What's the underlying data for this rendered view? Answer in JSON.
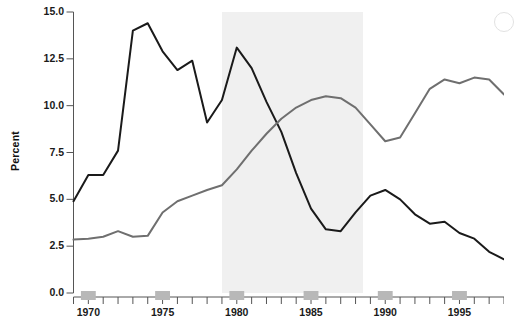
{
  "chart_data": {
    "type": "line",
    "title": "",
    "subtitle": "",
    "xlabel": "",
    "ylabel": "Percent",
    "xlim": [
      1969,
      1998
    ],
    "ylim": [
      0.0,
      15.0
    ],
    "grid": false,
    "legend_position": "none",
    "y_ticks": [
      "0.0",
      "2.5",
      "5.0",
      "7.5",
      "10.0",
      "12.5",
      "15.0"
    ],
    "y_tick_values": [
      0.0,
      2.5,
      5.0,
      7.5,
      10.0,
      12.5,
      15.0
    ],
    "x_ticks_labeled": [
      "1970",
      "1975",
      "1980",
      "1985",
      "1990",
      "1995"
    ],
    "x_tick_values_labeled": [
      1970,
      1975,
      1980,
      1985,
      1990,
      1995
    ],
    "x_minor_ticks": [
      1969,
      1970,
      1971,
      1972,
      1973,
      1974,
      1975,
      1976,
      1977,
      1978,
      1979,
      1980,
      1981,
      1982,
      1983,
      1984,
      1985,
      1986,
      1987,
      1988,
      1989,
      1990,
      1991,
      1992,
      1993,
      1994,
      1995,
      1996,
      1997,
      1998
    ],
    "shaded_bands": [
      {
        "name": "highlight-band",
        "x_start": 1979.0,
        "x_end": 1988.5,
        "color": "#f0f0f0"
      }
    ],
    "x": [
      1969,
      1970,
      1971,
      1972,
      1973,
      1974,
      1975,
      1976,
      1977,
      1978,
      1979,
      1980,
      1981,
      1982,
      1983,
      1984,
      1985,
      1986,
      1987,
      1988,
      1989,
      1990,
      1991,
      1992,
      1993,
      1994,
      1995,
      1996,
      1997,
      1998
    ],
    "series": [
      {
        "name": "dark-series",
        "color": "#1a1a1a",
        "width": 2.0,
        "values": [
          4.9,
          6.3,
          6.3,
          7.6,
          14.0,
          14.4,
          12.9,
          11.9,
          12.4,
          9.1,
          10.3,
          13.1,
          12.0,
          10.2,
          8.6,
          6.4,
          4.5,
          3.4,
          3.3,
          4.3,
          5.2,
          5.5,
          5.0,
          4.2,
          3.7,
          3.8,
          3.2,
          2.9,
          2.2,
          1.8
        ]
      },
      {
        "name": "gray-series",
        "color": "#6f6f6f",
        "width": 2.0,
        "values": [
          2.85,
          2.9,
          3.0,
          3.3,
          3.0,
          3.05,
          4.3,
          4.9,
          5.2,
          5.5,
          5.75,
          6.6,
          7.6,
          8.5,
          9.3,
          9.9,
          10.3,
          10.5,
          10.4,
          9.9,
          9.0,
          8.1,
          8.3,
          9.6,
          10.9,
          11.4,
          11.2,
          11.5,
          11.4,
          10.6
        ]
      }
    ]
  },
  "axes": {
    "y_label": "Percent",
    "y_tick_labels": [
      "15.0",
      "12.5",
      "10.0",
      "7.5",
      "5.0",
      "2.5",
      "0.0"
    ],
    "x_tick_labels": [
      "1970",
      "1975",
      "1980",
      "1985",
      "1990",
      "1995"
    ]
  }
}
